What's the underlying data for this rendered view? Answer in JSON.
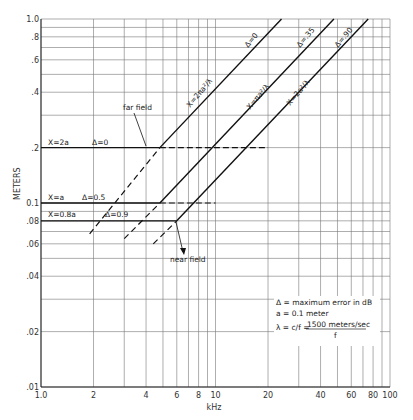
{
  "chart_data": {
    "type": "line",
    "title": "",
    "xlabel": "kHz",
    "ylabel": "METERS",
    "xscale": "log",
    "yscale": "log",
    "xlim": [
      1.0,
      100
    ],
    "ylim": [
      0.01,
      1.0
    ],
    "grid": true,
    "x_ticks": [
      1.0,
      2,
      4,
      6,
      8,
      10,
      20,
      40,
      60,
      80,
      100
    ],
    "x_tick_labels": [
      "1.0",
      "2",
      "4",
      "6",
      "8",
      "10",
      "20",
      "40",
      "60",
      "80",
      "100"
    ],
    "y_ticks": [
      1.0,
      0.8,
      0.6,
      0.4,
      0.2,
      0.1,
      0.08,
      0.06,
      0.04,
      0.02,
      0.01
    ],
    "y_tick_labels": [
      "1.0",
      ".8",
      ".6",
      ".4",
      ".2",
      "0.1",
      ".08",
      ".06",
      ".04",
      ".02",
      ".01"
    ],
    "series": [
      {
        "name": "X = 2πa²/λ (Δ = 0)",
        "style": "solid",
        "x": [
          4.8,
          23.9
        ],
        "y": [
          0.2,
          1.0
        ]
      },
      {
        "name": "X = πa²/λ (Δ = .35)",
        "style": "solid",
        "x": [
          4.8,
          47.7
        ],
        "y": [
          0.1,
          1.0
        ]
      },
      {
        "name": "X = 2a²/λ (Δ = .90)",
        "style": "solid",
        "x": [
          6.0,
          75.0
        ],
        "y": [
          0.08,
          1.0
        ]
      },
      {
        "name": "X = 2a (Δ = 0)",
        "style": "solid-then-dashed",
        "x": [
          1.0,
          4.8,
          20
        ],
        "y": [
          0.2,
          0.2,
          0.2
        ]
      },
      {
        "name": "X = a (Δ = 0.5)",
        "style": "solid-then-dashed",
        "x": [
          1.0,
          4.8,
          10
        ],
        "y": [
          0.1,
          0.1,
          0.1
        ]
      },
      {
        "name": "X = 0.8a (Δ = 0.9)",
        "style": "solid",
        "x": [
          1.0,
          6.0
        ],
        "y": [
          0.08,
          0.08
        ]
      },
      {
        "name": "far field extension",
        "style": "dashed",
        "x": [
          1.9,
          4.8
        ],
        "y": [
          0.068,
          0.2
        ]
      },
      {
        "name": "near field extension A",
        "style": "dashed",
        "x": [
          3.0,
          4.8
        ],
        "y": [
          0.064,
          0.1
        ]
      },
      {
        "name": "near field extension B",
        "style": "dashed",
        "x": [
          4.4,
          6.0
        ],
        "y": [
          0.06,
          0.08
        ]
      }
    ],
    "annotations": [
      {
        "text": "far field",
        "x": 3.3,
        "y": 0.27
      },
      {
        "text": "near field",
        "x": 6.2,
        "y": 0.05
      },
      {
        "text": "X=2a",
        "x": 1.1,
        "y": 0.2
      },
      {
        "text": "Δ=0",
        "x": 2.1,
        "y": 0.2
      },
      {
        "text": "X=a",
        "x": 1.1,
        "y": 0.1
      },
      {
        "text": "Δ=0.5",
        "x": 2.1,
        "y": 0.1
      },
      {
        "text": "X=0.8a",
        "x": 1.1,
        "y": 0.082
      },
      {
        "text": "Δ=0.9",
        "x": 3.4,
        "y": 0.082
      }
    ],
    "legend": {
      "position": "lower-right",
      "lines": [
        "Δ = maximum error in dB",
        "a = 0.1 meter",
        "λ = c/f = 1500 meters/sec / f"
      ]
    }
  },
  "labels": {
    "xlabel": "kHz",
    "ylabel": "METERS",
    "far_field": "far field",
    "near_field": "near field",
    "x2a": "X=2a",
    "xa": "X=a",
    "x08a": "X=0.8a",
    "d0_left": "Δ=0",
    "d05": "Δ=0.5",
    "d09": "Δ=0.9",
    "line1_top": "Δ=0",
    "line1_eq": "X=2πa²/λ",
    "line2_top": "Δ=.35",
    "line2_eq": "X=πa²/λ",
    "line3_top": "Δ=.90",
    "line3_eq": "X=2a²/λ",
    "note1": "Δ = maximum error in dB",
    "note2": "a = 0.1 meter",
    "note3a": "λ = c/f = ",
    "note3b": "1500 meters/sec",
    "note3c": "f"
  }
}
